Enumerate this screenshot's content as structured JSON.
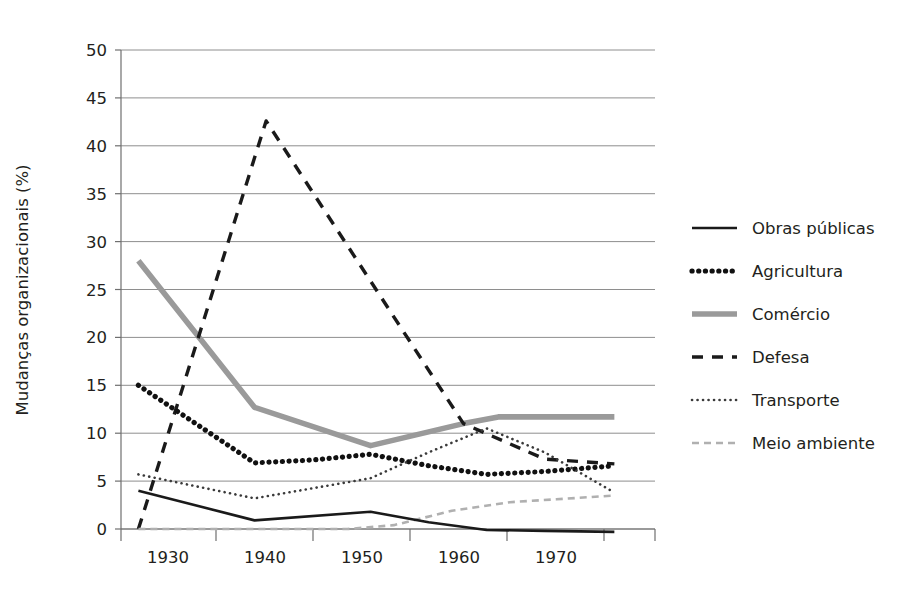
{
  "chart_data": {
    "type": "line",
    "title": "",
    "xlabel": "",
    "ylabel": "Mudanças organizacionais (%)",
    "xlim": [
      1928.5,
      1974.5
    ],
    "ylim": [
      0,
      50
    ],
    "ytick_labels": [
      "0",
      "5",
      "10",
      "15",
      "20",
      "25",
      "30",
      "35",
      "40",
      "45",
      "50"
    ],
    "ytick_values": [
      0,
      5,
      10,
      15,
      20,
      25,
      30,
      35,
      40,
      45,
      50
    ],
    "xtick_labels": [
      "1930",
      "1940",
      "1950",
      "1960",
      "1970"
    ],
    "xtick_values": [
      1930,
      1940,
      1950,
      1960,
      1970
    ],
    "grid": "horizontal",
    "legend_position": "right",
    "series": [
      {
        "name": "Obras públicas",
        "style": "solid-thin-black",
        "color": "#1a1a1a",
        "x": [
          1930,
          1940,
          1950,
          1955,
          1960,
          1965,
          1971
        ],
        "values": [
          4.0,
          0.9,
          1.8,
          0.7,
          -0.1,
          -0.2,
          -0.3
        ]
      },
      {
        "name": "Agricultura",
        "style": "dotted-thick-black",
        "color": "#111111",
        "x": [
          1930,
          1940,
          1945,
          1950,
          1955,
          1960,
          1965,
          1971
        ],
        "values": [
          15.0,
          6.9,
          7.2,
          7.8,
          6.6,
          5.7,
          6.0,
          6.6
        ]
      },
      {
        "name": "Comércio",
        "style": "solid-thick-gray",
        "color": "#9a9a9a",
        "x": [
          1930,
          1940,
          1950,
          1958,
          1961,
          1971
        ],
        "values": [
          28.0,
          12.7,
          8.7,
          11.0,
          11.7,
          11.7
        ]
      },
      {
        "name": "Defesa",
        "style": "dashed-black",
        "color": "#1a1a1a",
        "x": [
          1930,
          1941,
          1958,
          1965,
          1971
        ],
        "values": [
          0.0,
          42.6,
          11.0,
          7.3,
          6.8
        ]
      },
      {
        "name": "Transporte",
        "style": "dotted-fine-dark",
        "color": "#3a3a3a",
        "x": [
          1930,
          1940,
          1950,
          1955,
          1960,
          1965,
          1971
        ],
        "values": [
          5.7,
          3.2,
          5.3,
          8.0,
          10.5,
          8.0,
          3.8
        ]
      },
      {
        "name": "Meio ambiente",
        "style": "dashed-gray",
        "color": "#b0b0b0",
        "x": [
          1930,
          1948,
          1952,
          1957,
          1962,
          1966,
          1971
        ],
        "values": [
          0.0,
          0.0,
          0.4,
          1.9,
          2.8,
          3.1,
          3.5
        ]
      }
    ]
  },
  "legend": {
    "items": [
      {
        "label": "Obras públicas",
        "swatch": "solid-thin-black"
      },
      {
        "label": "Agricultura",
        "swatch": "dotted-thick-black"
      },
      {
        "label": "Comércio",
        "swatch": "solid-thick-gray"
      },
      {
        "label": "Defesa",
        "swatch": "dashed-black"
      },
      {
        "label": "Transporte",
        "swatch": "dotted-fine-dark"
      },
      {
        "label": "Meio ambiente",
        "swatch": "dashed-gray"
      }
    ]
  },
  "axes": {
    "y_axis_title": "Mudanças organizacionais (%)"
  }
}
